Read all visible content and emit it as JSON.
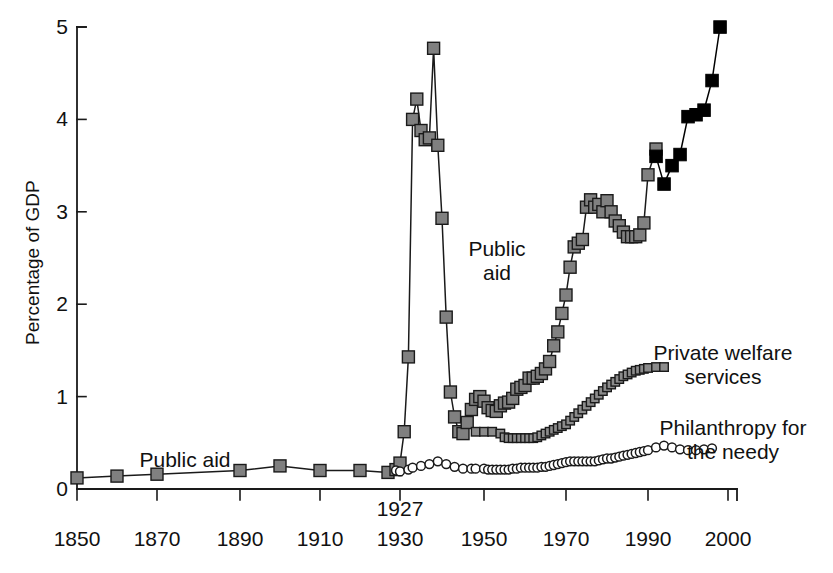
{
  "chart_data": {
    "type": "line",
    "title": "",
    "xlabel": "",
    "ylabel": "Percentage of GDP",
    "ylim": [
      0,
      5
    ],
    "xlim": [
      1850,
      2000
    ],
    "grid": false,
    "legend_position": "inline-annotations",
    "y_ticks": [
      "0",
      "1",
      "2",
      "3",
      "4",
      "5"
    ],
    "x_ticks": [
      "1850",
      "1870",
      "1890",
      "1910",
      "1930",
      "1950",
      "1970",
      "1990",
      "2000"
    ],
    "x_tick_px": [
      77,
      157,
      240,
      320,
      400,
      484,
      566,
      648,
      728
    ],
    "axis_note": "1927",
    "axis_note_year": 1930,
    "annotations": [
      {
        "name": "public-aid-early",
        "text": "Public aid",
        "x": 185,
        "y": 448
      },
      {
        "name": "public-aid-modern",
        "text": "Public\naid",
        "x": 497,
        "y": 237
      },
      {
        "name": "private-welfare",
        "text": "Private welfare\nservices",
        "x": 723,
        "y": 341
      },
      {
        "name": "philanthropy",
        "text": "Philanthropy for\nthe needy",
        "x": 733,
        "y": 416
      }
    ],
    "series": [
      {
        "name": "Public aid",
        "marker": "filled-square-gray",
        "color": "#808080",
        "edge_color": "#1a1a1a",
        "x": [
          1850,
          1860,
          1870,
          1890,
          1900,
          1910,
          1920,
          1927,
          1929,
          1930,
          1931,
          1932,
          1933,
          1934,
          1935,
          1936,
          1937,
          1938,
          1939,
          1940,
          1941,
          1942,
          1943,
          1944,
          1945,
          1946,
          1947,
          1948,
          1949,
          1950,
          1951,
          1952,
          1953,
          1954,
          1955,
          1956,
          1957,
          1958,
          1959,
          1960,
          1961,
          1962,
          1963,
          1964,
          1965,
          1966,
          1967,
          1968,
          1969,
          1970,
          1971,
          1972,
          1973,
          1974,
          1975,
          1976,
          1977,
          1978,
          1979,
          1980,
          1981,
          1982,
          1983,
          1984,
          1985,
          1986,
          1987,
          1988,
          1989,
          1990,
          1991
        ],
        "values": [
          0.12,
          0.14,
          0.16,
          0.2,
          0.25,
          0.2,
          0.2,
          0.18,
          0.21,
          0.28,
          0.62,
          1.43,
          4.0,
          4.22,
          3.88,
          3.78,
          3.8,
          4.77,
          3.72,
          2.93,
          1.86,
          1.05,
          0.78,
          0.62,
          0.6,
          0.72,
          0.86,
          0.97,
          1.0,
          0.95,
          0.88,
          0.85,
          0.84,
          0.9,
          0.93,
          0.94,
          0.98,
          1.08,
          1.1,
          1.12,
          1.2,
          1.2,
          1.22,
          1.25,
          1.3,
          1.38,
          1.55,
          1.7,
          1.9,
          2.1,
          2.4,
          2.62,
          2.66,
          2.7,
          3.05,
          3.13,
          3.05,
          3.08,
          3.0,
          3.12,
          3.0,
          2.9,
          2.85,
          2.78,
          2.73,
          2.73,
          2.73,
          2.75,
          2.88,
          3.4,
          3.68
        ]
      },
      {
        "name": "Public aid (recent)",
        "marker": "filled-square-black",
        "color": "#000000",
        "edge_color": "#000000",
        "x": [
          1991,
          1992,
          1993,
          1994,
          1995,
          1996,
          1997,
          1998,
          1999
        ],
        "values": [
          3.6,
          3.3,
          3.5,
          3.62,
          4.03,
          4.05,
          4.1,
          4.42,
          5.0
        ]
      },
      {
        "name": "Private welfare services",
        "marker": "small-square-gray",
        "color": "#8c8c8c",
        "edge_color": "#1a1a1a",
        "x": [
          1948,
          1950,
          1952,
          1954,
          1955,
          1956,
          1957,
          1958,
          1959,
          1960,
          1961,
          1962,
          1963,
          1964,
          1965,
          1966,
          1967,
          1968,
          1969,
          1970,
          1971,
          1972,
          1973,
          1974,
          1975,
          1976,
          1977,
          1978,
          1979,
          1980,
          1981,
          1982,
          1983,
          1984,
          1985,
          1986,
          1987,
          1988,
          1989,
          1990,
          1991,
          1992
        ],
        "values": [
          0.62,
          0.62,
          0.62,
          0.6,
          0.56,
          0.55,
          0.55,
          0.55,
          0.55,
          0.55,
          0.55,
          0.55,
          0.56,
          0.58,
          0.6,
          0.62,
          0.64,
          0.66,
          0.68,
          0.7,
          0.74,
          0.78,
          0.82,
          0.86,
          0.9,
          0.94,
          0.98,
          1.02,
          1.06,
          1.1,
          1.13,
          1.16,
          1.19,
          1.22,
          1.24,
          1.26,
          1.28,
          1.29,
          1.3,
          1.31,
          1.32,
          1.32
        ]
      },
      {
        "name": "Philanthropy for the needy",
        "marker": "open-circle",
        "color": "#ffffff",
        "edge_color": "#1a1a1a",
        "x": [
          1929,
          1930,
          1932,
          1933,
          1935,
          1937,
          1939,
          1941,
          1943,
          1945,
          1947,
          1948,
          1950,
          1951,
          1952,
          1953,
          1954,
          1955,
          1956,
          1957,
          1958,
          1959,
          1960,
          1961,
          1962,
          1963,
          1964,
          1965,
          1966,
          1967,
          1968,
          1969,
          1970,
          1971,
          1972,
          1973,
          1974,
          1975,
          1976,
          1977,
          1978,
          1979,
          1980,
          1981,
          1982,
          1983,
          1984,
          1985,
          1986,
          1987,
          1988,
          1989,
          1990,
          1991,
          1992,
          1993,
          1994,
          1995,
          1996,
          1997,
          1998
        ],
        "values": [
          0.2,
          0.19,
          0.21,
          0.23,
          0.25,
          0.27,
          0.3,
          0.27,
          0.24,
          0.22,
          0.22,
          0.22,
          0.22,
          0.21,
          0.21,
          0.21,
          0.21,
          0.21,
          0.21,
          0.22,
          0.22,
          0.23,
          0.23,
          0.23,
          0.23,
          0.23,
          0.24,
          0.24,
          0.25,
          0.26,
          0.27,
          0.28,
          0.29,
          0.3,
          0.3,
          0.3,
          0.3,
          0.3,
          0.3,
          0.3,
          0.31,
          0.32,
          0.33,
          0.33,
          0.34,
          0.35,
          0.36,
          0.37,
          0.38,
          0.39,
          0.4,
          0.41,
          0.42,
          0.45,
          0.47,
          0.45,
          0.43,
          0.42,
          0.42,
          0.43,
          0.44
        ]
      }
    ]
  }
}
